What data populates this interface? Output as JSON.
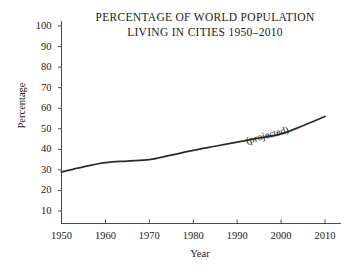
{
  "chart_data": {
    "type": "line",
    "title": "PERCENTAGE OF WORLD POPULATION LIVING IN CITIES 1950–2010",
    "title_lines": [
      "PERCENTAGE OF WORLD POPULATION",
      "LIVING IN CITIES 1950–2010"
    ],
    "xlabel": "Year",
    "ylabel": "Percentage",
    "x": [
      1950,
      1955,
      1960,
      1965,
      1970,
      1975,
      1980,
      1985,
      1990,
      1995,
      2000,
      2005,
      2010
    ],
    "values": [
      29,
      31.5,
      33.5,
      34.3,
      35,
      37.2,
      39.5,
      41.5,
      43.5,
      45.5,
      47.5,
      51.5,
      56
    ],
    "xlim": [
      1950,
      2010
    ],
    "ylim": [
      0,
      105
    ],
    "xticks": [
      1950,
      1960,
      1970,
      1980,
      1990,
      2000,
      2010
    ],
    "xtick_labels": [
      "1950",
      "1960",
      "1970",
      "1980",
      "1990",
      "2000",
      "2010"
    ],
    "yticks": [
      10,
      20,
      30,
      40,
      50,
      60,
      70,
      80,
      90,
      100
    ],
    "ytick_labels": [
      "10",
      "20",
      "30",
      "40",
      "50",
      "60",
      "70",
      "80",
      "90",
      "100"
    ],
    "grid": false,
    "legend": false,
    "line_color": "#2b2b2b",
    "axis_color": "#4a4a4a",
    "background": "#ffffff",
    "annotations": [
      {
        "text": "(projected)",
        "x": 1992,
        "y": 47,
        "rotation": -15
      }
    ]
  }
}
